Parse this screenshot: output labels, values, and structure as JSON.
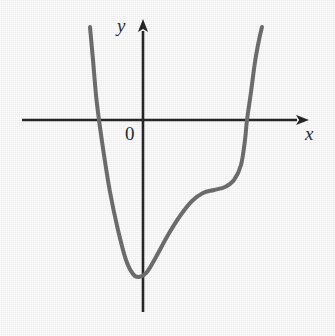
{
  "figure": {
    "kind": "cartesian-graph",
    "width": 335,
    "height": 336,
    "background_color": "#f0f0f0"
  },
  "labels": {
    "y_axis": "y",
    "x_axis": "x",
    "origin": "0"
  },
  "colors": {
    "axis": "#262626",
    "curve": "#6b6b6b",
    "label": "#2a2a2a",
    "background": "#f0f0f0"
  },
  "chart_data": {
    "type": "line",
    "title": "",
    "xlabel": "x",
    "ylabel": "y",
    "grid": false,
    "legend": "none",
    "axes": {
      "origin_label": "0",
      "origin_px": [
        143,
        120
      ],
      "x_axis_px": {
        "y": 120,
        "x_start": 22,
        "x_end": 305,
        "arrow": "right"
      },
      "y_axis_px": {
        "x": 143,
        "y_start": 22,
        "y_end": 312,
        "arrow": "up"
      },
      "tick_labels_x": [],
      "tick_labels_y": [],
      "xlim": [],
      "ylim": []
    },
    "annotations": [],
    "series": [
      {
        "name": "curve",
        "color": "#6b6b6b",
        "stroke_width": 4,
        "description": "Quintic-like curve: steep descent from upper left, local minimum below the origin just left of the y-axis, rise to a flat saddle/inflection plateau to the right, then steep ascent through the x-axis to the upper right.",
        "features": {
          "x_intercepts_px": [
            [
              99,
              120
            ],
            [
              247,
              120
            ]
          ],
          "local_minimum_px": [
            135,
            277
          ],
          "saddle_plateau_px": [
            214,
            190
          ],
          "left_end_px": [
            90,
            27
          ],
          "right_end_px": [
            262,
            27
          ]
        },
        "path_px": [
          [
            90,
            27
          ],
          [
            93,
            60
          ],
          [
            96,
            95
          ],
          [
            99,
            120
          ],
          [
            104,
            155
          ],
          [
            110,
            192
          ],
          [
            118,
            230
          ],
          [
            126,
            260
          ],
          [
            133,
            274
          ],
          [
            139,
            277
          ],
          [
            147,
            272
          ],
          [
            156,
            257
          ],
          [
            168,
            235
          ],
          [
            180,
            216
          ],
          [
            192,
            201
          ],
          [
            203,
            193
          ],
          [
            214,
            190
          ],
          [
            225,
            187
          ],
          [
            234,
            180
          ],
          [
            241,
            165
          ],
          [
            245,
            140
          ],
          [
            247,
            120
          ],
          [
            251,
            92
          ],
          [
            255,
            62
          ],
          [
            259,
            40
          ],
          [
            262,
            27
          ]
        ]
      }
    ]
  }
}
